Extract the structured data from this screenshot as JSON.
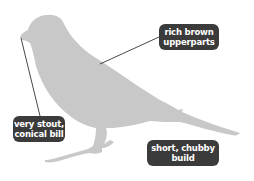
{
  "diagram": {
    "silhouette_color": "#c8c8c8",
    "label_bg_color": "#3b3b3b",
    "label_text_color": "#ffffff",
    "leader_line_color": "#333333",
    "annotations": [
      {
        "id": "upperparts",
        "line1": "rich brown",
        "line2": "upperparts"
      },
      {
        "id": "bill",
        "line1": "very stout,",
        "line2": "conical bill"
      },
      {
        "id": "build",
        "line1": "short, chubby",
        "line2": "build"
      }
    ]
  }
}
